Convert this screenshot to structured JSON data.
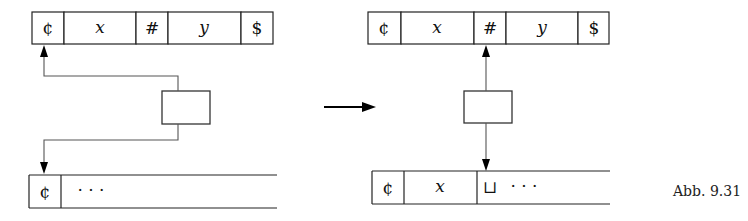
{
  "figure": {
    "caption": "Abb. 9.31",
    "colors": {
      "stroke": "#222222",
      "connector": "#555555",
      "background": "#ffffff"
    }
  },
  "before": {
    "input_tape": {
      "cells": [
        {
          "symbol": "¢",
          "italic": false
        },
        {
          "symbol": "x",
          "italic": true
        },
        {
          "symbol": "#",
          "italic": false
        },
        {
          "symbol": "y",
          "italic": true
        },
        {
          "symbol": "$",
          "italic": false
        }
      ]
    },
    "work_tape": {
      "cells": [
        {
          "symbol": "¢",
          "italic": false
        },
        {
          "symbol": "· · ·",
          "italic": false
        }
      ]
    }
  },
  "transition_arrow": "→",
  "after": {
    "input_tape": {
      "cells": [
        {
          "symbol": "¢",
          "italic": false
        },
        {
          "symbol": "x",
          "italic": true
        },
        {
          "symbol": "#",
          "italic": false
        },
        {
          "symbol": "y",
          "italic": true
        },
        {
          "symbol": "$",
          "italic": false
        }
      ]
    },
    "work_tape": {
      "cells": [
        {
          "symbol": "¢",
          "italic": false
        },
        {
          "symbol": "x",
          "italic": true
        },
        {
          "symbol": "⊔",
          "italic": false
        },
        {
          "symbol": "· · ·",
          "italic": false
        }
      ]
    }
  }
}
